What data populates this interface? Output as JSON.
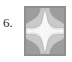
{
  "figure": {
    "number_label": "6.",
    "caption": "",
    "icon": {
      "name": "four-pointed-star-cross-glyph",
      "description": "white four-pointed concave star cross on gray square tile",
      "colors": {
        "background": "#ffffff",
        "tile_fill": "#c9c9c9",
        "tile_border": "#8f8f8f",
        "star_fill": "#f7f7f7",
        "star_edge": "#b0b0b0",
        "corner_wedge": "#9d9d9d",
        "label_text": "#2b2b2b"
      },
      "geometry": {
        "tile_x": 24,
        "tile_y": 6,
        "tile_width": 42,
        "tile_height": 50,
        "points": 4,
        "symmetry": "4-fold"
      }
    }
  }
}
